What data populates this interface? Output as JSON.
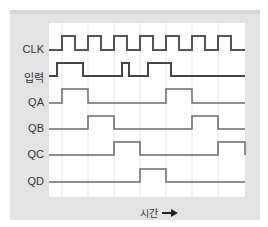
{
  "diagram": {
    "type": "timing-diagram",
    "colors": {
      "panel_bg": "#e3e3e3",
      "plot_bg": "#ffffff",
      "gridline": "#e6e6e6",
      "clk_line": "#555555",
      "input_line": "#444444",
      "output_line": "#6a6a6a",
      "label": "#333333"
    },
    "plot_area": {
      "x0": 49,
      "x1": 245,
      "y0": 23,
      "y1": 197
    },
    "gridlines_x": [
      62,
      88,
      114,
      140,
      166,
      192,
      218
    ],
    "signals": [
      {
        "name": "CLK",
        "label": "CLK",
        "low_y": 50,
        "high_y": 36,
        "start_x": 49,
        "end_x": 245,
        "start_level": 0,
        "edges": [
          62,
          75,
          88,
          101,
          114,
          127,
          140,
          153,
          166,
          179,
          192,
          205,
          218,
          231
        ]
      },
      {
        "name": "input",
        "label": "입력",
        "low_y": 76,
        "high_y": 63,
        "start_x": 49,
        "end_x": 245,
        "start_level": 0,
        "edges": [
          57,
          83,
          122,
          129,
          148,
          171
        ]
      },
      {
        "name": "QA",
        "label": "QA",
        "low_y": 103,
        "high_y": 89,
        "start_x": 49,
        "end_x": 245,
        "start_level": 0,
        "edges": [
          62,
          88,
          166,
          192
        ]
      },
      {
        "name": "QB",
        "label": "QB",
        "low_y": 129,
        "high_y": 116,
        "start_x": 49,
        "end_x": 245,
        "start_level": 0,
        "edges": [
          88,
          114,
          192,
          218
        ]
      },
      {
        "name": "QC",
        "label": "QC",
        "low_y": 155,
        "high_y": 142,
        "start_x": 49,
        "end_x": 245,
        "start_level": 0,
        "edges": [
          114,
          140,
          218,
          245
        ]
      },
      {
        "name": "QD",
        "label": "QD",
        "low_y": 182,
        "high_y": 169,
        "start_x": 49,
        "end_x": 245,
        "start_level": 0,
        "edges": [
          140,
          166
        ]
      }
    ],
    "time_axis": {
      "label": "시간",
      "arrow": "right-arrow-icon"
    }
  }
}
